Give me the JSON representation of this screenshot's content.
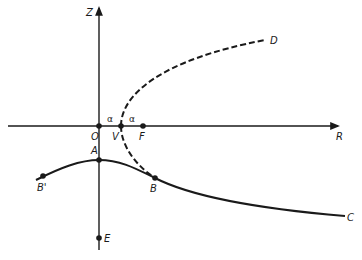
{
  "diagram": {
    "colors": {
      "ink": "#1a1a1a",
      "background": "#ffffff"
    },
    "axes": {
      "vertical": {
        "label": "Z"
      },
      "horizontal": {
        "label": "R"
      }
    },
    "points": {
      "origin": {
        "label": "O"
      },
      "vertex": {
        "label": "V"
      },
      "focus": {
        "label": "F"
      },
      "apex": {
        "label": "A"
      },
      "B": {
        "label": "B"
      },
      "B_prime": {
        "label": "B'"
      },
      "E": {
        "label": "E"
      }
    },
    "curve_ends": {
      "dashed_end": {
        "label": "D"
      },
      "solid_end": {
        "label": "C"
      }
    },
    "distances": {
      "OV": {
        "label": "α"
      },
      "VF": {
        "label": "α"
      }
    }
  }
}
